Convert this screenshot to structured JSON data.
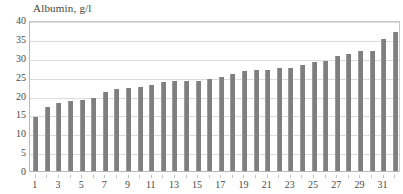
{
  "chart_data": {
    "type": "bar",
    "title": "Albumin, g/l",
    "xlabel": "",
    "ylabel": "",
    "ylim": [
      0,
      40
    ],
    "ytick_labels": [
      "0",
      "5",
      "10",
      "15",
      "20",
      "25",
      "30",
      "35",
      "40"
    ],
    "yticks": [
      0,
      5,
      10,
      15,
      20,
      25,
      30,
      35,
      40
    ],
    "grid": true,
    "legend": "none",
    "bar_color": "#7f7f7f",
    "categories": [
      "1",
      "2",
      "3",
      "4",
      "5",
      "6",
      "7",
      "8",
      "9",
      "10",
      "11",
      "12",
      "13",
      "14",
      "15",
      "16",
      "17",
      "18",
      "19",
      "20",
      "21",
      "22",
      "23",
      "24",
      "25",
      "26",
      "27",
      "28",
      "29",
      "30",
      "31",
      "32"
    ],
    "xtick_labels_shown": [
      "1",
      "3",
      "5",
      "7",
      "9",
      "11",
      "13",
      "15",
      "17",
      "19",
      "21",
      "23",
      "25",
      "27",
      "29",
      "31"
    ],
    "values": [
      14.3,
      16.9,
      17.9,
      18.5,
      18.9,
      19.3,
      20.8,
      21.8,
      22.1,
      22.2,
      22.8,
      23.6,
      23.9,
      23.8,
      23.9,
      24.5,
      24.8,
      25.6,
      26.4,
      26.7,
      26.8,
      27.3,
      27.2,
      28.1,
      28.8,
      29.2,
      30.5,
      31.0,
      31.7,
      31.9,
      35.0,
      36.8
    ]
  },
  "axis": {
    "y_title": "Albumin, g/l"
  }
}
